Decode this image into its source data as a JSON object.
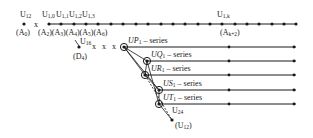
{
  "diagram": {
    "top_line": {
      "labels_above": [
        "U12",
        "U1,0",
        "U1,1",
        "U1,2",
        "U1,3",
        "U1,k"
      ],
      "labels_below": [
        "(A0)",
        "(A2)(A3)(A4)(A5)(A6)",
        "(Ak+2)"
      ]
    },
    "branch": {
      "node_label": "U16",
      "node_sublabel": "(D4)",
      "crosses": "x  x  x"
    },
    "series": [
      {
        "name": "UP1",
        "suffix": " – series"
      },
      {
        "name": "UQ1",
        "suffix": " – series"
      },
      {
        "name": "UR1",
        "suffix": " – series"
      },
      {
        "name": "US1",
        "suffix": " – series"
      },
      {
        "name": "UT1",
        "suffix": " – series"
      }
    ],
    "tail": {
      "label": "U24",
      "end_label": "(U12)"
    },
    "colors": {
      "ink": "#1a1a1a",
      "background": "#ffffff"
    }
  }
}
